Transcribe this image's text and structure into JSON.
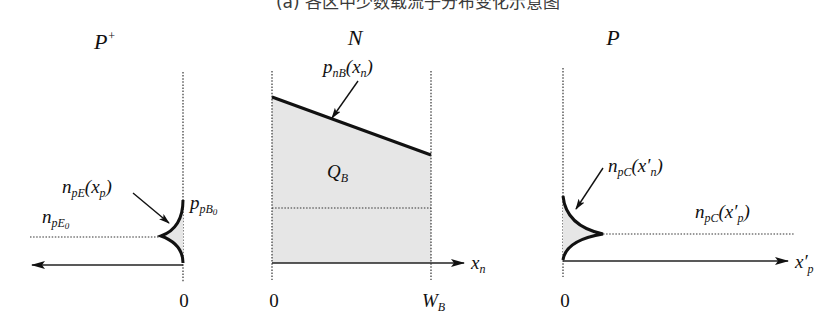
{
  "caption": "(a) 各区中少数载流子分布变化示意图",
  "panels": {
    "left": {
      "region_label": "P",
      "region_sup": "+",
      "curve_label": {
        "main": "n",
        "sub": "pE",
        "arg": "(x",
        "arg_sub": "p",
        "close": ")"
      },
      "equilibrium_label": {
        "main": "n",
        "sub": "pE",
        "subsub": "0"
      },
      "boundary_label": {
        "main": "p",
        "sub": "pB",
        "subsub": "0"
      },
      "origin_tick": "0",
      "axis_direction": "left"
    },
    "middle": {
      "region_label": "N",
      "curve_label": {
        "main": "p",
        "sub": "nB",
        "arg": "(x",
        "arg_sub": "n",
        "close": ")"
      },
      "area_label": {
        "main": "Q",
        "sub": "B"
      },
      "origin_tick": "0",
      "end_tick": {
        "main": "W",
        "sub": "B"
      },
      "axis_label": {
        "main": "x",
        "sub": "n"
      },
      "axis_direction": "right"
    },
    "right": {
      "region_label": "P",
      "curve_label": {
        "main": "n",
        "sub": "pC",
        "arg": "(x′",
        "arg_sub": "n",
        "close": ")"
      },
      "equilibrium_label": {
        "main": "n",
        "sub": "pC",
        "arg": "(x′",
        "arg_sub": "p",
        "close": ")"
      },
      "origin_tick": "0",
      "axis_label": {
        "main": "x′",
        "sub": "p"
      },
      "axis_direction": "right"
    }
  },
  "colors": {
    "shade": "#e6e6e6",
    "ink": "#111111"
  }
}
